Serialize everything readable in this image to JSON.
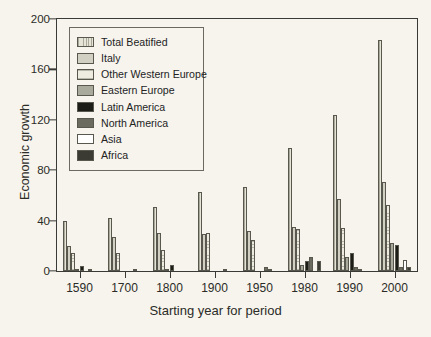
{
  "chart_data": {
    "type": "bar",
    "title": "",
    "subtitle": "",
    "xlabel": "Starting year for period",
    "ylabel": "Economic growth",
    "categories": [
      "1590",
      "1700",
      "1800",
      "1900",
      "1950",
      "1980",
      "1990",
      "2000"
    ],
    "ylim": [
      0,
      200
    ],
    "yticks": [
      0,
      40,
      80,
      120,
      160,
      200
    ],
    "grid": false,
    "legend_position": "top-left",
    "series": [
      {
        "name": "Total Beatified",
        "key": "total",
        "color": "#e6e4d6",
        "pattern": "cross-hatch",
        "values": [
          40,
          42,
          51,
          63,
          67,
          98,
          124,
          183
        ]
      },
      {
        "name": "Italy",
        "key": "italy",
        "color": "#d2d0c2",
        "pattern": "solid-light-gray",
        "values": [
          20,
          27,
          30,
          29,
          32,
          35,
          57,
          71
        ]
      },
      {
        "name": "Other Western Europe",
        "key": "otherwe",
        "color": "#eeece1",
        "pattern": "horizontal-lines",
        "values": [
          14,
          14,
          17,
          30,
          25,
          33,
          34,
          52
        ]
      },
      {
        "name": "Eastern Europe",
        "key": "easteu",
        "color": "#a9a99c",
        "pattern": "solid-mid-gray",
        "values": [
          1,
          0,
          1,
          0,
          0,
          5,
          11,
          22
        ]
      },
      {
        "name": "Latin America",
        "key": "latam",
        "color": "#1d1d18",
        "pattern": "solid-black",
        "values": [
          4,
          0,
          5,
          0,
          0,
          8,
          14,
          21
        ]
      },
      {
        "name": "North America",
        "key": "northam",
        "color": "#6b6b60",
        "pattern": "solid-dark-gray",
        "values": [
          0,
          0,
          0,
          0,
          3,
          11,
          3,
          3
        ]
      },
      {
        "name": "Asia",
        "key": "asia",
        "color": "#ffffff",
        "pattern": "solid-white",
        "values": [
          0.5,
          0.7,
          0,
          1.5,
          1,
          0,
          1,
          9
        ]
      },
      {
        "name": "Africa",
        "key": "africa",
        "color": "#3b3b33",
        "pattern": "solid-near-black",
        "values": [
          0,
          0,
          0,
          0,
          0,
          8,
          0,
          3
        ]
      }
    ]
  },
  "axis": {
    "y_title": "Economic growth",
    "x_title": "Starting year for period",
    "y_labels": [
      "0",
      "40",
      "80",
      "120",
      "160",
      "200"
    ],
    "x_labels": [
      "1590",
      "1700",
      "1800",
      "1900",
      "1950",
      "1980",
      "1990",
      "2000"
    ]
  },
  "legend": {
    "items": [
      {
        "label": "Total Beatified"
      },
      {
        "label": "Italy"
      },
      {
        "label": "Other Western Europe"
      },
      {
        "label": "Eastern Europe"
      },
      {
        "label": "Latin America"
      },
      {
        "label": "North America"
      },
      {
        "label": "Asia"
      },
      {
        "label": "Africa"
      }
    ]
  },
  "colors": {
    "background": "#f6f4ec",
    "axis": "#3a3a36",
    "text": "#2b2b28"
  }
}
